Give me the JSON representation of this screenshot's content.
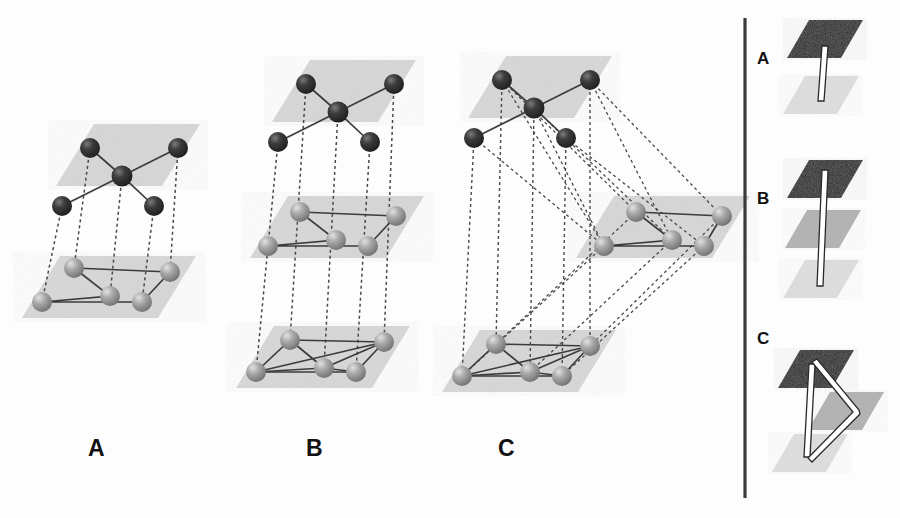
{
  "figure": {
    "type": "layer-stacking-diagram",
    "background_color": "#fdfdfd",
    "panels": [
      {
        "id": "A",
        "label": "A",
        "label_x": 88,
        "label_y": 437,
        "layer_count": 2,
        "description": "Two stacked lattice planes connected by vertical dotted lines"
      },
      {
        "id": "B",
        "label": "B",
        "label_x": 306,
        "label_y": 437,
        "layer_count": 3,
        "description": "Three stacked lattice planes connected by vertical dotted lines"
      },
      {
        "id": "C",
        "label": "C",
        "label_x": 498,
        "label_y": 437,
        "layer_count": 3,
        "description": "Three lattice planes with the middle plane laterally offset, joined by oblique dotted lines"
      }
    ],
    "inset": {
      "divider_color": "#3a3a3a",
      "items": [
        {
          "id": "A",
          "label": "A",
          "label_x": 757,
          "label_y": 50,
          "plane_count": 2,
          "connector": "straight-vertical"
        },
        {
          "id": "B",
          "label": "B",
          "label_x": 757,
          "label_y": 190,
          "plane_count": 3,
          "connector": "straight-vertical-long"
        },
        {
          "id": "C",
          "label": "C",
          "label_x": 757,
          "label_y": 330,
          "plane_count": 3,
          "connector": "zigzag-triangular"
        }
      ],
      "plane_shades": {
        "dark": "#262626",
        "medium": "#b2b2b2",
        "light": "#dedede"
      }
    },
    "colors": {
      "plane_fill": "#d7d7d7",
      "sphere_dark": "#2f2f2f",
      "sphere_dark_highlight": "#6e6e6e",
      "sphere_light": "#9a9a9a",
      "sphere_light_highlight": "#d9d9d9",
      "bond_line": "#3c3c3c",
      "dotted_line": "#4a4a4a"
    }
  }
}
